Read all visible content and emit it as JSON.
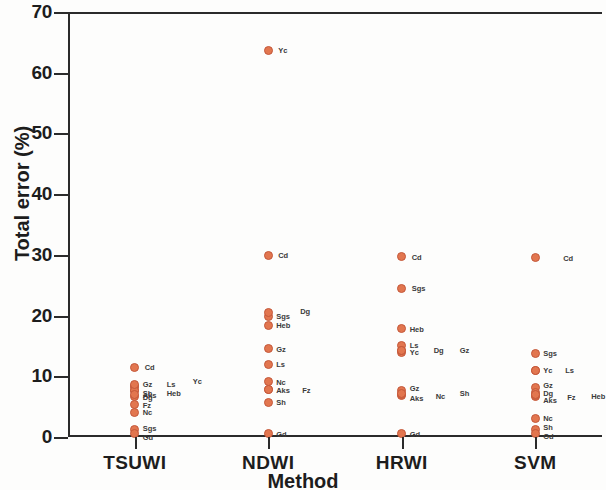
{
  "chart_data": {
    "type": "scatter",
    "title": "",
    "xlabel": "Method",
    "ylabel": "Total error (%)",
    "categories": [
      "TSUWI",
      "NDWI",
      "HRWI",
      "SVM"
    ],
    "ylim": [
      0,
      70
    ],
    "y_ticks": [
      0,
      10,
      20,
      30,
      40,
      50,
      60,
      70
    ],
    "grid": false,
    "legend": "none",
    "marker_color": "#e2764f",
    "marker_edge_color": "#c4583a",
    "axis_color": "#2b2b2b",
    "series": [
      {
        "name": "TSUWI",
        "points": [
          {
            "label": "Cd",
            "value": 11.5,
            "label_dx": 10,
            "label_dy": 0
          },
          {
            "label": "Gz",
            "value": 8.3,
            "label_dx": 8,
            "label_dy": -3
          },
          {
            "label": "Ls",
            "value": 8.3,
            "label_dx": 32,
            "label_dy": -3
          },
          {
            "label": "Sh",
            "value": 7.6,
            "label_dx": 8,
            "label_dy": 2
          },
          {
            "label": "Heb",
            "value": 7.6,
            "label_dx": 32,
            "label_dy": 2
          },
          {
            "label": "Yc",
            "value": 8.6,
            "label_dx": 58,
            "label_dy": -4
          },
          {
            "label": "Dg",
            "value": 6.6,
            "label_dx": 8,
            "label_dy": 0
          },
          {
            "label": "Fz",
            "value": 5.3,
            "label_dx": 8,
            "label_dy": 0
          },
          {
            "label": "Nc",
            "value": 4.1,
            "label_dx": 8,
            "label_dy": 0
          },
          {
            "label": "Sgs",
            "value": 1.2,
            "label_dx": 8,
            "label_dy": -2
          },
          {
            "label": "Gd",
            "value": 0.5,
            "label_dx": 8,
            "label_dy": 3
          },
          {
            "label": "Aks",
            "value": 7.0,
            "label_dx": 0,
            "label_dy": 0
          }
        ]
      },
      {
        "name": "NDWI",
        "points": [
          {
            "label": "Yc",
            "value": 63.7,
            "label_dx": 10,
            "label_dy": 0
          },
          {
            "label": "Cd",
            "value": 29.9,
            "label_dx": 10,
            "label_dy": 0
          },
          {
            "label": "Sgs",
            "value": 19.9,
            "label_dx": 8,
            "label_dy": 0
          },
          {
            "label": "Dg",
            "value": 20.5,
            "label_dx": 32,
            "label_dy": -2
          },
          {
            "label": "Heb",
            "value": 18.4,
            "label_dx": 8,
            "label_dy": 0
          },
          {
            "label": "Gz",
            "value": 14.5,
            "label_dx": 8,
            "label_dy": 0
          },
          {
            "label": "Ls",
            "value": 12.0,
            "label_dx": 8,
            "label_dy": 0
          },
          {
            "label": "Nc",
            "value": 9.1,
            "label_dx": 8,
            "label_dy": 0
          },
          {
            "label": "Aks",
            "value": 7.8,
            "label_dx": 8,
            "label_dy": 0
          },
          {
            "label": "Fz",
            "value": 7.8,
            "label_dx": 34,
            "label_dy": 0
          },
          {
            "label": "Sh",
            "value": 5.7,
            "label_dx": 8,
            "label_dy": 0
          },
          {
            "label": "Gd",
            "value": 0.5,
            "label_dx": 8,
            "label_dy": 0
          }
        ]
      },
      {
        "name": "HRWI",
        "points": [
          {
            "label": "Cd",
            "value": 29.7,
            "label_dx": 10,
            "label_dy": 0
          },
          {
            "label": "Sgs",
            "value": 24.5,
            "label_dx": 10,
            "label_dy": 0
          },
          {
            "label": "Heb",
            "value": 17.8,
            "label_dx": 8,
            "label_dy": 0
          },
          {
            "label": "Ls",
            "value": 15.1,
            "label_dx": 8,
            "label_dy": 0
          },
          {
            "label": "Yc",
            "value": 14.0,
            "label_dx": 8,
            "label_dy": 0
          },
          {
            "label": "Dg",
            "value": 14.3,
            "label_dx": 32,
            "label_dy": 0
          },
          {
            "label": "Gz",
            "value": 14.3,
            "label_dx": 58,
            "label_dy": 0
          },
          {
            "label": "Gz",
            "value": 7.6,
            "label_dx": 8,
            "label_dy": -3
          },
          {
            "label": "Aks",
            "value": 6.8,
            "label_dx": 8,
            "label_dy": 2
          },
          {
            "label": "Nc",
            "value": 7.0,
            "label_dx": 34,
            "label_dy": 1
          },
          {
            "label": "Sh",
            "value": 7.2,
            "label_dx": 58,
            "label_dy": 0
          },
          {
            "label": "Gd",
            "value": 0.5,
            "label_dx": 8,
            "label_dy": 0
          }
        ]
      },
      {
        "name": "SVM",
        "points": [
          {
            "label": "Cd",
            "value": 29.5,
            "label_dx": 28,
            "label_dy": 0
          },
          {
            "label": "Sgs",
            "value": 13.8,
            "label_dx": 8,
            "label_dy": 0
          },
          {
            "label": "Yc",
            "value": 11.0,
            "label_dx": 8,
            "label_dy": 0
          },
          {
            "label": "Ls",
            "value": 11.0,
            "label_dx": 30,
            "label_dy": 0
          },
          {
            "label": "Gz",
            "value": 8.1,
            "label_dx": 8,
            "label_dy": -3
          },
          {
            "label": "Dg",
            "value": 7.3,
            "label_dx": 8,
            "label_dy": 0
          },
          {
            "label": "Aks",
            "value": 6.6,
            "label_dx": 8,
            "label_dy": 3
          },
          {
            "label": "Fz",
            "value": 6.9,
            "label_dx": 32,
            "label_dy": 2
          },
          {
            "label": "Heb",
            "value": 7.0,
            "label_dx": 56,
            "label_dy": 1
          },
          {
            "label": "Nc",
            "value": 3.1,
            "label_dx": 8,
            "label_dy": 0
          },
          {
            "label": "Sh",
            "value": 1.3,
            "label_dx": 8,
            "label_dy": -2
          },
          {
            "label": "Gd",
            "value": 0.6,
            "label_dx": 8,
            "label_dy": 3
          }
        ]
      }
    ]
  }
}
